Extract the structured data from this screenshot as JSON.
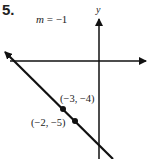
{
  "problem": {
    "number": "5.",
    "slope_var": "m",
    "slope_text": " = −1"
  },
  "axes": {
    "y_label": "y"
  },
  "points": [
    {
      "label": "(−3, −4)",
      "x": -3,
      "y": -4
    },
    {
      "label": "(−2, −5)",
      "x": -2,
      "y": -5
    }
  ],
  "line": {
    "slope": -1,
    "color": "#111111"
  }
}
